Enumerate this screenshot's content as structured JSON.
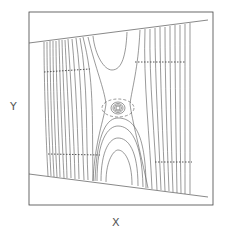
{
  "figure": {
    "x_label": "X",
    "y_label": "Y",
    "colors": {
      "line": "#555555",
      "frame": "#444444",
      "background": "#ffffff"
    },
    "vortex_center": [
      118,
      108
    ]
  }
}
